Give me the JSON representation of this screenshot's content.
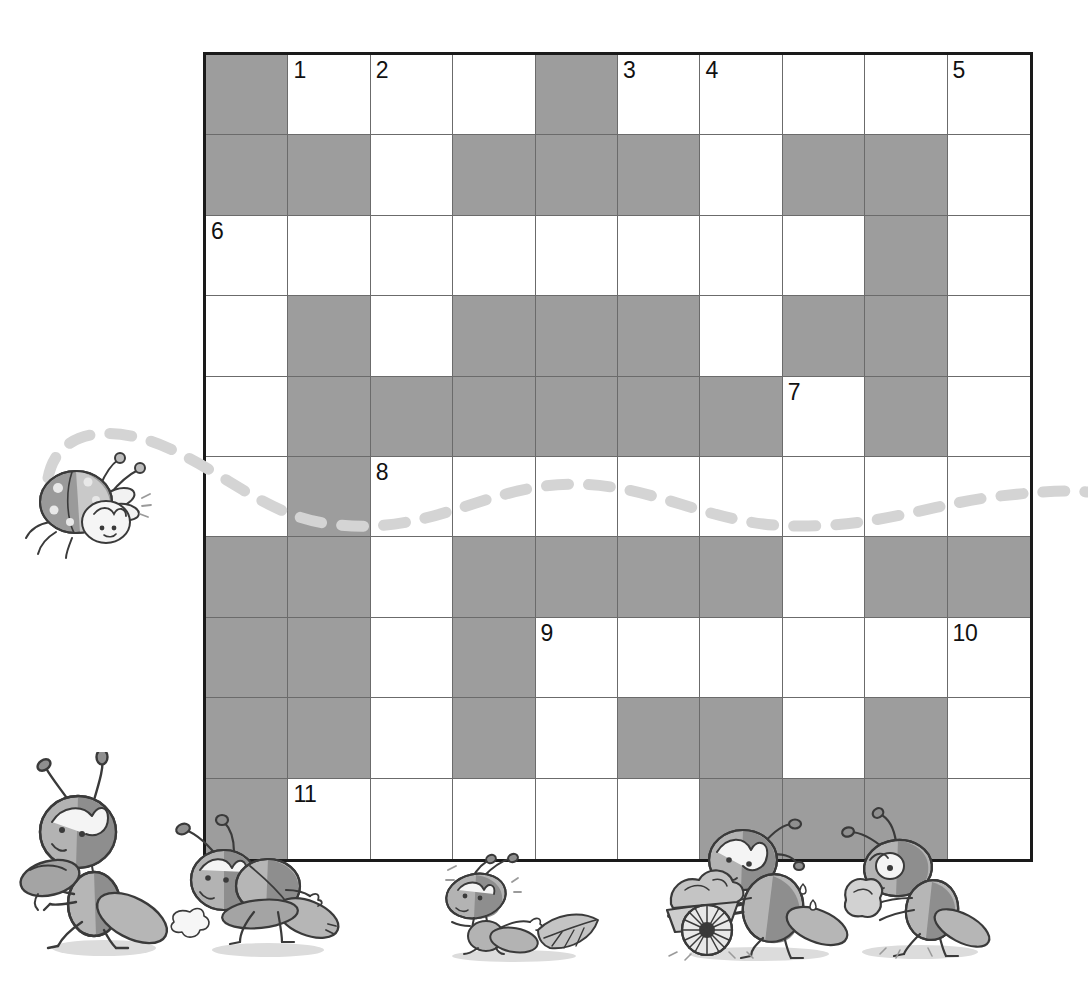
{
  "puzzle": {
    "title": "Ant Crossword Puzzle",
    "rows": 10,
    "columns": 10,
    "colors": {
      "blocked_cell": "#9d9d9d",
      "open_cell": "#ffffff",
      "grid_line": "#6b6b6b",
      "grid_border": "#1a1a1a",
      "trail": "#d4d4d4",
      "illustration_ink": "#3a3a3a"
    },
    "legend": {
      "blocked_label": "blocked",
      "open_label": "open"
    },
    "grid": [
      [
        "blocked",
        "open",
        "open",
        "open",
        "blocked",
        "open",
        "open",
        "open",
        "open",
        "open"
      ],
      [
        "blocked",
        "blocked",
        "open",
        "blocked",
        "blocked",
        "blocked",
        "open",
        "blocked",
        "blocked",
        "open"
      ],
      [
        "open",
        "open",
        "open",
        "open",
        "open",
        "open",
        "open",
        "open",
        "blocked",
        "open"
      ],
      [
        "open",
        "blocked",
        "open",
        "blocked",
        "blocked",
        "blocked",
        "open",
        "blocked",
        "blocked",
        "open"
      ],
      [
        "open",
        "blocked",
        "blocked",
        "blocked",
        "blocked",
        "blocked",
        "blocked",
        "open",
        "blocked",
        "open"
      ],
      [
        "open",
        "blocked",
        "open",
        "open",
        "open",
        "open",
        "open",
        "open",
        "open",
        "open"
      ],
      [
        "blocked",
        "blocked",
        "open",
        "blocked",
        "blocked",
        "blocked",
        "blocked",
        "open",
        "blocked",
        "blocked"
      ],
      [
        "blocked",
        "blocked",
        "open",
        "blocked",
        "open",
        "open",
        "open",
        "open",
        "open",
        "open"
      ],
      [
        "blocked",
        "blocked",
        "open",
        "blocked",
        "open",
        "blocked",
        "blocked",
        "open",
        "blocked",
        "open"
      ],
      [
        "blocked",
        "open",
        "open",
        "open",
        "open",
        "open",
        "blocked",
        "blocked",
        "blocked",
        "open"
      ]
    ],
    "numbers": [
      {
        "label": "1",
        "row": 1,
        "col": 2
      },
      {
        "label": "2",
        "row": 1,
        "col": 3
      },
      {
        "label": "3",
        "row": 1,
        "col": 6
      },
      {
        "label": "4",
        "row": 1,
        "col": 7
      },
      {
        "label": "5",
        "row": 1,
        "col": 10
      },
      {
        "label": "6",
        "row": 3,
        "col": 1
      },
      {
        "label": "7",
        "row": 5,
        "col": 8
      },
      {
        "label": "8",
        "row": 6,
        "col": 3
      },
      {
        "label": "9",
        "row": 8,
        "col": 5
      },
      {
        "label": "10",
        "row": 8,
        "col": 10
      },
      {
        "label": "11",
        "row": 10,
        "col": 2
      }
    ],
    "letters": []
  },
  "decorations": {
    "trail": {
      "name": "dashed-flight-trail",
      "style": "dashed",
      "color": "#d4d4d4"
    },
    "critters": [
      {
        "id": "flying-bug",
        "name": "flying-ladybug-icon",
        "description": "flying ladybug with motion trail"
      },
      {
        "id": "ant-walking",
        "name": "ant-walking-icon",
        "description": "ant walking upright"
      },
      {
        "id": "ant-pushing",
        "name": "ant-pushing-icon",
        "description": "ant straining and pushing"
      },
      {
        "id": "ant-leaf",
        "name": "ant-dragging-leaf-icon",
        "description": "ant dragging a leaf"
      },
      {
        "id": "ant-barrow",
        "name": "ant-wheelbarrow-icon",
        "description": "ant pushing a loaded wheelbarrow"
      },
      {
        "id": "ant-crumb",
        "name": "ant-carrying-crumb-icon",
        "description": "ant carrying a crumb"
      }
    ]
  }
}
